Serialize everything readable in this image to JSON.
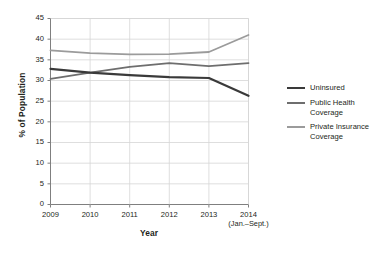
{
  "chart_data": {
    "type": "line",
    "title": "",
    "xlabel": "Year",
    "ylabel": "% of Population",
    "categories": [
      "2009",
      "2010",
      "2011",
      "2012",
      "2013",
      "2014"
    ],
    "x_tick_sublabels": [
      "",
      "",
      "",
      "",
      "",
      "(Jan.–Sept.)"
    ],
    "ylim": [
      0,
      45
    ],
    "ytick_step": 5,
    "ytick_labels": [
      "0",
      "5",
      "10",
      "15",
      "20",
      "25",
      "30",
      "35",
      "40",
      "45"
    ],
    "grid": "horizontal-and-vertical",
    "legend_position": "right",
    "series": [
      {
        "name": "Uninsured",
        "color": "#3a3a3a",
        "width": 2.2,
        "values": [
          32.8,
          31.9,
          31.3,
          30.8,
          30.6,
          26.3
        ]
      },
      {
        "name": "Public Health Coverage",
        "color": "#6e6e6e",
        "width": 1.8,
        "values": [
          30.4,
          31.9,
          33.3,
          34.2,
          33.5,
          34.2
        ]
      },
      {
        "name": "Private Insurance Coverage",
        "color": "#9b9b9b",
        "width": 1.8,
        "values": [
          37.3,
          36.6,
          36.3,
          36.4,
          36.9,
          41.0
        ]
      }
    ]
  },
  "legend": {
    "items": [
      {
        "label": "Uninsured",
        "color": "#3a3a3a"
      },
      {
        "label": "Public Health Coverage",
        "color": "#6e6e6e"
      },
      {
        "label": "Private Insurance Coverage",
        "color": "#9b9b9b"
      }
    ]
  },
  "axes": {
    "y_title": "% of Population",
    "x_title": "Year",
    "axis_color": "#7f7f7f",
    "grid_color": "#d6d6d6"
  }
}
